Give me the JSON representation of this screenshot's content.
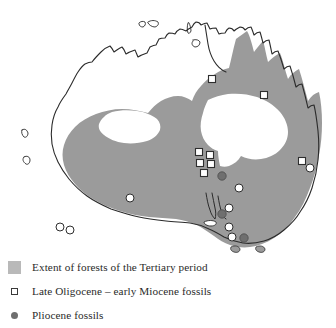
{
  "map": {
    "title": "Extent of forests of the Tertiary period in Australia",
    "region": "Australia",
    "colors": {
      "forest_fill": "#9b9b9b",
      "legend_swatch": "#b9b9b9",
      "coastline": "#2b2b2b",
      "background": "#ffffff",
      "square_marker_fill": "#ffffff",
      "square_marker_stroke": "#2e2e2e",
      "circle_marker_fill": "#ffffff",
      "circle_marker_stroke": "#2e2e2e",
      "pliocene_marker_fill": "#6f6f6f"
    },
    "markers": {
      "late_oligocene_early_miocene": [
        {
          "x": 212,
          "y": 79
        },
        {
          "x": 264,
          "y": 95
        },
        {
          "x": 199,
          "y": 152
        },
        {
          "x": 210,
          "y": 155
        },
        {
          "x": 200,
          "y": 163
        },
        {
          "x": 211,
          "y": 164
        },
        {
          "x": 204,
          "y": 173
        },
        {
          "x": 302,
          "y": 161
        }
      ],
      "white_circles": [
        {
          "x": 310,
          "y": 168
        },
        {
          "x": 130,
          "y": 198
        },
        {
          "x": 60,
          "y": 227
        },
        {
          "x": 70,
          "y": 230
        },
        {
          "x": 239,
          "y": 188
        },
        {
          "x": 229,
          "y": 208
        },
        {
          "x": 229,
          "y": 227
        },
        {
          "x": 232,
          "y": 237
        }
      ],
      "pliocene_fossils": [
        {
          "x": 222,
          "y": 176
        },
        {
          "x": 222,
          "y": 214
        },
        {
          "x": 244,
          "y": 238
        }
      ]
    }
  },
  "legend": {
    "items": [
      {
        "marker": "gray-swatch-icon",
        "label": "Extent of forests of the Tertiary period"
      },
      {
        "marker": "open-square-icon",
        "label": "Late Oligocene – early Miocene fossils"
      },
      {
        "marker": "filled-circle-icon",
        "label": "Pliocene fossils"
      }
    ]
  }
}
